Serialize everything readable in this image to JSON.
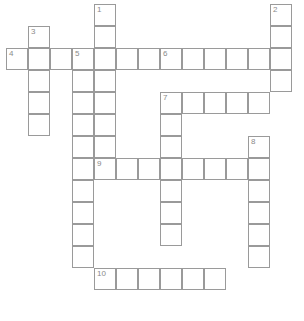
{
  "puzzle": {
    "kind": "crossword-grid",
    "title": "",
    "grid": {
      "origin_x": 6,
      "origin_y": 4,
      "cell_size": 22,
      "columns": 14,
      "rows": 14,
      "line_color": "#9a9a9a",
      "cell_color": "#ffffff",
      "number_color": "#8a8a8a",
      "background": "#ffffff"
    },
    "clue_numbers_visible": [
      "1",
      "2",
      "3",
      "4",
      "5",
      "6",
      "7",
      "8",
      "9",
      "10"
    ],
    "entries": [
      {
        "number": "1",
        "direction": "down",
        "col": 4,
        "row": 0,
        "length": 8
      },
      {
        "number": "2",
        "direction": "down",
        "col": 12,
        "row": 0,
        "length": 4
      },
      {
        "number": "3",
        "direction": "down",
        "col": 1,
        "row": 1,
        "length": 5
      },
      {
        "number": "4",
        "direction": "across",
        "col": 0,
        "row": 2,
        "length": 12
      },
      {
        "number": "5",
        "direction": "down",
        "col": 3,
        "row": 2,
        "length": 10
      },
      {
        "number": "6",
        "direction": "across",
        "col": 7,
        "row": 2,
        "length": 5
      },
      {
        "number": "7",
        "direction": "across",
        "col": 7,
        "row": 4,
        "length": 5
      },
      {
        "number": "8",
        "direction": "down",
        "col": 11,
        "row": 6,
        "length": 6
      },
      {
        "number": "9",
        "direction": "across",
        "col": 4,
        "row": 7,
        "length": 8
      },
      {
        "number": "10",
        "direction": "across",
        "col": 4,
        "row": 12,
        "length": 6
      }
    ],
    "cells": [
      {
        "col": 4,
        "row": 0,
        "number": "1",
        "letter": ""
      },
      {
        "col": 12,
        "row": 0,
        "number": "2",
        "letter": ""
      },
      {
        "col": 1,
        "row": 1,
        "number": "3",
        "letter": ""
      },
      {
        "col": 4,
        "row": 1,
        "number": "",
        "letter": ""
      },
      {
        "col": 12,
        "row": 1,
        "number": "",
        "letter": ""
      },
      {
        "col": 0,
        "row": 2,
        "number": "4",
        "letter": ""
      },
      {
        "col": 1,
        "row": 2,
        "number": "",
        "letter": ""
      },
      {
        "col": 2,
        "row": 2,
        "number": "",
        "letter": ""
      },
      {
        "col": 3,
        "row": 2,
        "number": "5",
        "letter": ""
      },
      {
        "col": 4,
        "row": 2,
        "number": "",
        "letter": ""
      },
      {
        "col": 5,
        "row": 2,
        "number": "",
        "letter": ""
      },
      {
        "col": 6,
        "row": 2,
        "number": "",
        "letter": ""
      },
      {
        "col": 7,
        "row": 2,
        "number": "6",
        "letter": ""
      },
      {
        "col": 8,
        "row": 2,
        "number": "",
        "letter": ""
      },
      {
        "col": 9,
        "row": 2,
        "number": "",
        "letter": ""
      },
      {
        "col": 10,
        "row": 2,
        "number": "",
        "letter": ""
      },
      {
        "col": 11,
        "row": 2,
        "number": "",
        "letter": ""
      },
      {
        "col": 12,
        "row": 2,
        "number": "",
        "letter": ""
      },
      {
        "col": 1,
        "row": 3,
        "number": "",
        "letter": ""
      },
      {
        "col": 3,
        "row": 3,
        "number": "",
        "letter": ""
      },
      {
        "col": 4,
        "row": 3,
        "number": "",
        "letter": ""
      },
      {
        "col": 12,
        "row": 3,
        "number": "",
        "letter": ""
      },
      {
        "col": 1,
        "row": 4,
        "number": "",
        "letter": ""
      },
      {
        "col": 3,
        "row": 4,
        "number": "",
        "letter": ""
      },
      {
        "col": 4,
        "row": 4,
        "number": "",
        "letter": ""
      },
      {
        "col": 7,
        "row": 4,
        "number": "7",
        "letter": ""
      },
      {
        "col": 8,
        "row": 4,
        "number": "",
        "letter": ""
      },
      {
        "col": 9,
        "row": 4,
        "number": "",
        "letter": ""
      },
      {
        "col": 10,
        "row": 4,
        "number": "",
        "letter": ""
      },
      {
        "col": 11,
        "row": 4,
        "number": "",
        "letter": ""
      },
      {
        "col": 1,
        "row": 5,
        "number": "",
        "letter": ""
      },
      {
        "col": 3,
        "row": 5,
        "number": "",
        "letter": ""
      },
      {
        "col": 4,
        "row": 5,
        "number": "",
        "letter": ""
      },
      {
        "col": 7,
        "row": 5,
        "number": "",
        "letter": ""
      },
      {
        "col": 3,
        "row": 6,
        "number": "",
        "letter": ""
      },
      {
        "col": 4,
        "row": 6,
        "number": "",
        "letter": ""
      },
      {
        "col": 7,
        "row": 6,
        "number": "",
        "letter": ""
      },
      {
        "col": 11,
        "row": 6,
        "number": "8",
        "letter": ""
      },
      {
        "col": 3,
        "row": 7,
        "number": "",
        "letter": ""
      },
      {
        "col": 4,
        "row": 7,
        "number": "9",
        "letter": ""
      },
      {
        "col": 5,
        "row": 7,
        "number": "",
        "letter": ""
      },
      {
        "col": 6,
        "row": 7,
        "number": "",
        "letter": ""
      },
      {
        "col": 7,
        "row": 7,
        "number": "",
        "letter": ""
      },
      {
        "col": 8,
        "row": 7,
        "number": "",
        "letter": ""
      },
      {
        "col": 9,
        "row": 7,
        "number": "",
        "letter": ""
      },
      {
        "col": 10,
        "row": 7,
        "number": "",
        "letter": ""
      },
      {
        "col": 11,
        "row": 7,
        "number": "",
        "letter": ""
      },
      {
        "col": 3,
        "row": 8,
        "number": "",
        "letter": ""
      },
      {
        "col": 7,
        "row": 8,
        "number": "",
        "letter": ""
      },
      {
        "col": 11,
        "row": 8,
        "number": "",
        "letter": ""
      },
      {
        "col": 3,
        "row": 9,
        "number": "",
        "letter": ""
      },
      {
        "col": 7,
        "row": 9,
        "number": "",
        "letter": ""
      },
      {
        "col": 11,
        "row": 9,
        "number": "",
        "letter": ""
      },
      {
        "col": 3,
        "row": 10,
        "number": "",
        "letter": ""
      },
      {
        "col": 7,
        "row": 10,
        "number": "",
        "letter": ""
      },
      {
        "col": 11,
        "row": 10,
        "number": "",
        "letter": ""
      },
      {
        "col": 3,
        "row": 11,
        "number": "",
        "letter": ""
      },
      {
        "col": 11,
        "row": 11,
        "number": "",
        "letter": ""
      },
      {
        "col": 4,
        "row": 12,
        "number": "10",
        "letter": ""
      },
      {
        "col": 5,
        "row": 12,
        "number": "",
        "letter": ""
      },
      {
        "col": 6,
        "row": 12,
        "number": "",
        "letter": ""
      },
      {
        "col": 7,
        "row": 12,
        "number": "",
        "letter": ""
      },
      {
        "col": 8,
        "row": 12,
        "number": "",
        "letter": ""
      },
      {
        "col": 9,
        "row": 12,
        "number": "",
        "letter": ""
      }
    ]
  }
}
